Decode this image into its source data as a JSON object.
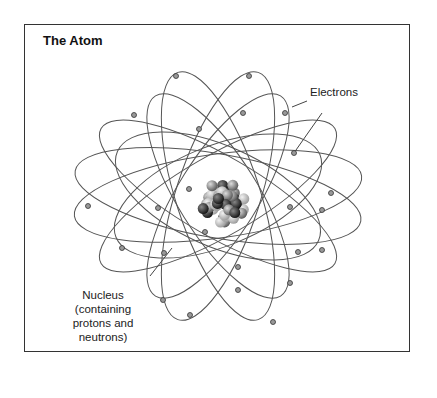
{
  "title": "The Atom",
  "labels": {
    "electrons": "Electrons",
    "nucleus_line1": "Nucleus",
    "nucleus_line2": "(containing",
    "nucleus_line3": "protons  and",
    "nucleus_line4": "neutrons)"
  },
  "colors": {
    "orbit": "#555555",
    "electron_fill": "#999999",
    "border": "#333333"
  },
  "orbits": [
    {
      "cx": 218,
      "cy": 196,
      "rx": 145,
      "ry": 42,
      "rot": -8
    },
    {
      "cx": 218,
      "cy": 196,
      "rx": 145,
      "ry": 42,
      "rot": 10
    },
    {
      "cx": 218,
      "cy": 196,
      "rx": 110,
      "ry": 50,
      "rot": -22
    },
    {
      "cx": 218,
      "cy": 196,
      "rx": 110,
      "ry": 50,
      "rot": 24
    },
    {
      "cx": 218,
      "cy": 196,
      "rx": 135,
      "ry": 40,
      "rot": 30
    },
    {
      "cx": 218,
      "cy": 196,
      "rx": 135,
      "ry": 40,
      "rot": -30
    },
    {
      "cx": 218,
      "cy": 196,
      "rx": 130,
      "ry": 42,
      "rot": 72
    },
    {
      "cx": 218,
      "cy": 196,
      "rx": 130,
      "ry": 42,
      "rot": -72
    },
    {
      "cx": 218,
      "cy": 196,
      "rx": 118,
      "ry": 40,
      "rot": 58
    },
    {
      "cx": 218,
      "cy": 196,
      "rx": 118,
      "ry": 40,
      "rot": -58
    }
  ],
  "electrons": [
    [
      176,
      76
    ],
    [
      249,
      76
    ],
    [
      285,
      113
    ],
    [
      134,
      115
    ],
    [
      243,
      113
    ],
    [
      199,
      129
    ],
    [
      294,
      153
    ],
    [
      331,
      193
    ],
    [
      88,
      206
    ],
    [
      158,
      208
    ],
    [
      189,
      189
    ],
    [
      290,
      207
    ],
    [
      322,
      210
    ],
    [
      122,
      248
    ],
    [
      164,
      253
    ],
    [
      322,
      250
    ],
    [
      205,
      232
    ],
    [
      163,
      300
    ],
    [
      238,
      290
    ],
    [
      290,
      283
    ],
    [
      190,
      315
    ],
    [
      273,
      322
    ],
    [
      238,
      267
    ],
    [
      298,
      252
    ]
  ]
}
